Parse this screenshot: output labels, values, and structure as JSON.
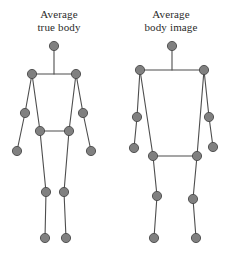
{
  "figure": {
    "background_color": "#ffffff",
    "joint_fill_color": "#808080",
    "joint_stroke_color": "#4a4a4a",
    "limb_color": "#4d4d4d",
    "caption_color": "#2b2b2b",
    "panels": [
      {
        "id": "true-body",
        "caption_line1": "Average",
        "caption_line2": "true body",
        "joints": {
          "head": [
            54,
            46
          ],
          "neck": [
            54,
            74
          ],
          "shoulder_left": [
            32,
            74
          ],
          "shoulder_right": [
            76,
            74
          ],
          "elbow_left": [
            25,
            113
          ],
          "elbow_right": [
            83,
            113
          ],
          "wrist_left": [
            17,
            151
          ],
          "wrist_right": [
            91,
            151
          ],
          "hip_left": [
            40,
            131
          ],
          "hip_right": [
            69,
            131
          ],
          "knee_left": [
            46,
            192
          ],
          "knee_right": [
            64,
            192
          ],
          "foot_left": [
            45,
            238
          ],
          "foot_right": [
            66,
            238
          ]
        },
        "segments": [
          [
            "head",
            "neck"
          ],
          [
            "shoulder_left",
            "shoulder_right"
          ],
          [
            "shoulder_left",
            "elbow_left"
          ],
          [
            "elbow_left",
            "wrist_left"
          ],
          [
            "shoulder_right",
            "elbow_right"
          ],
          [
            "elbow_right",
            "wrist_right"
          ],
          [
            "shoulder_left",
            "hip_left"
          ],
          [
            "shoulder_right",
            "hip_right"
          ],
          [
            "hip_left",
            "hip_right"
          ],
          [
            "hip_left",
            "knee_left"
          ],
          [
            "knee_left",
            "foot_left"
          ],
          [
            "hip_right",
            "knee_right"
          ],
          [
            "knee_right",
            "foot_right"
          ]
        ]
      },
      {
        "id": "body-image",
        "caption_line1": "Average",
        "caption_line2": "body image",
        "joints": {
          "head": [
            172,
            46
          ],
          "neck": [
            172,
            70
          ],
          "shoulder_left": [
            140,
            70
          ],
          "shoulder_right": [
            204,
            70
          ],
          "elbow_left": [
            137,
            117
          ],
          "elbow_right": [
            209,
            117
          ],
          "wrist_left": [
            134,
            148
          ],
          "wrist_right": [
            213,
            147
          ],
          "hip_left": [
            153,
            156
          ],
          "hip_right": [
            197,
            156
          ],
          "knee_left": [
            157,
            196
          ],
          "knee_right": [
            193,
            199
          ],
          "foot_left": [
            154,
            238
          ],
          "foot_right": [
            196,
            238
          ]
        },
        "segments": [
          [
            "head",
            "neck"
          ],
          [
            "shoulder_left",
            "shoulder_right"
          ],
          [
            "shoulder_left",
            "elbow_left"
          ],
          [
            "elbow_left",
            "wrist_left"
          ],
          [
            "shoulder_right",
            "elbow_right"
          ],
          [
            "elbow_right",
            "wrist_right"
          ],
          [
            "shoulder_left",
            "hip_left"
          ],
          [
            "shoulder_right",
            "hip_right"
          ],
          [
            "hip_left",
            "hip_right"
          ],
          [
            "hip_left",
            "knee_left"
          ],
          [
            "knee_left",
            "foot_left"
          ],
          [
            "hip_right",
            "knee_right"
          ],
          [
            "knee_right",
            "foot_right"
          ]
        ]
      }
    ],
    "joint_radius": 4.6,
    "head_radius": 4.6
  }
}
